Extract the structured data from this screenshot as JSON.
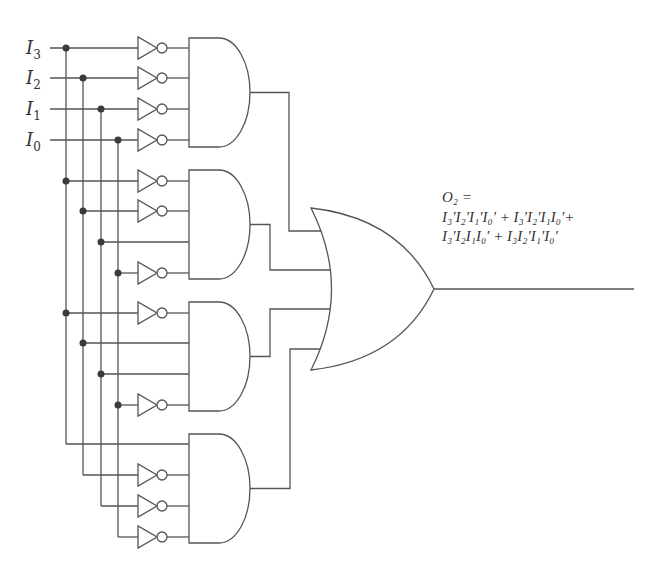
{
  "inputs": [
    {
      "name": "I",
      "sub": "3",
      "y": 48,
      "bus_x": 66
    },
    {
      "name": "I",
      "sub": "2",
      "y": 78,
      "bus_x": 83
    },
    {
      "name": "I",
      "sub": "1",
      "y": 109,
      "bus_x": 101
    },
    {
      "name": "I",
      "sub": "0",
      "y": 140,
      "bus_x": 118
    }
  ],
  "and_gates": [
    {
      "id": "and-1",
      "top": 38,
      "inputs": [
        48,
        78,
        109,
        140
      ],
      "inverted": [
        true,
        true,
        true,
        true
      ],
      "tap": [
        false,
        false,
        false,
        false
      ],
      "or_input_y": 231,
      "route_x": 289
    },
    {
      "id": "and-2",
      "top": 170,
      "inputs": [
        181,
        211,
        242,
        273
      ],
      "inverted": [
        true,
        true,
        false,
        true
      ],
      "tap": [
        true,
        true,
        true,
        true
      ],
      "or_input_y": 270,
      "route_x": 270
    },
    {
      "id": "and-3",
      "top": 302,
      "inputs": [
        313,
        343,
        374,
        405
      ],
      "inverted": [
        true,
        false,
        false,
        true
      ],
      "tap": [
        true,
        true,
        true,
        true
      ],
      "or_input_y": 309,
      "route_x": 270
    },
    {
      "id": "and-4",
      "top": 434,
      "inputs": [
        444,
        475,
        506,
        537
      ],
      "inverted": [
        false,
        true,
        true,
        true
      ],
      "tap": [
        false,
        false,
        false,
        false
      ],
      "or_input_y": 349,
      "route_x": 290
    }
  ],
  "or_gate": {
    "id": "or-1",
    "top": 208,
    "bottom": 370,
    "tip_x": 434,
    "out_y": 289
  },
  "output": {
    "label_line": "O₂ =",
    "term_line_1": "I₃′I₂′I₁′I₀′ + I₃′I₂′I₁I₀′+",
    "term_line_2": "I₃′I₂I₁I₀′ + I₃I₂′I₁′I₀′",
    "line_end_x": 634
  },
  "colors": {
    "wire": "#555555",
    "dot": "#3a3a3a",
    "background": "#ffffff"
  }
}
